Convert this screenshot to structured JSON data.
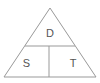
{
  "diagram": {
    "type": "formula-triangle",
    "shape": "triangle",
    "colors": {
      "stroke": "#999999",
      "background": "#ffffff",
      "text": "#555555"
    },
    "geometry": {
      "apex": [
        50,
        8
      ],
      "base_left": [
        4,
        77
      ],
      "base_right": [
        96,
        77
      ],
      "horizontal_divider": {
        "y": 46,
        "x_start": 25,
        "x_end": 75
      },
      "vertical_divider": {
        "x": 49,
        "y_start": 46,
        "y_end": 77
      },
      "stroke_width": 1
    },
    "cells": [
      {
        "id": "top",
        "label": "D",
        "position": "top"
      },
      {
        "id": "bottom-left",
        "label": "S",
        "position": "bottom-left"
      },
      {
        "id": "bottom-right",
        "label": "T",
        "position": "bottom-right"
      }
    ]
  }
}
